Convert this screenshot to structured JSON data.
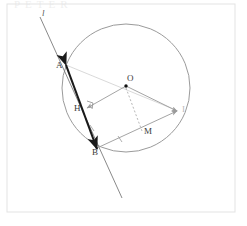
{
  "figure": {
    "watermark_text": "PETER",
    "frame": {
      "x": 7,
      "y": 4,
      "width": 228,
      "height": 208,
      "color": "#e3e3e3"
    },
    "background_color": "#ffffff",
    "circle": {
      "name": "circle-O",
      "center_x": 126,
      "center_y": 88,
      "radius": 64,
      "stroke_color": "#8f8f8f"
    },
    "points": [
      {
        "id": "A",
        "label": "A",
        "x": 66,
        "y": 66,
        "label_x": 56,
        "label_y": 61,
        "marked": false
      },
      {
        "id": "H",
        "label": "H",
        "x": 86,
        "y": 110,
        "label_x": 74,
        "label_y": 104,
        "marked": false
      },
      {
        "id": "B",
        "label": "B",
        "x": 97,
        "y": 148,
        "label_x": 92,
        "label_y": 148,
        "marked": false
      },
      {
        "id": "O",
        "label": "O",
        "x": 126,
        "y": 86,
        "label_x": 127,
        "label_y": 74,
        "marked": true
      },
      {
        "id": "M",
        "label": "M",
        "x": 142,
        "y": 130,
        "label_x": 144,
        "label_y": 127,
        "marked": false
      },
      {
        "id": "I",
        "label": "I",
        "x": 178,
        "y": 111,
        "label_x": 182,
        "label_y": 105,
        "marked": false
      }
    ],
    "line_l": {
      "name": "line-l",
      "label": "l",
      "label_x": 42,
      "label_y": 9,
      "x1": 40,
      "y1": 17,
      "x2": 122,
      "y2": 198,
      "stroke_color": "#6b6b6b"
    },
    "chord_AB": {
      "name": "chord-A-B",
      "x1": 66,
      "y1": 65,
      "x2": 97,
      "y2": 149,
      "stroke_color": "#1a1a1a",
      "stroke_width": 2.1
    },
    "vectors": [
      {
        "name": "vector-O-H",
        "x1": 126,
        "y1": 86,
        "x2": 87,
        "y2": 108,
        "color": "#9a9a9a"
      },
      {
        "name": "vector-O-I",
        "x1": 126,
        "y1": 86,
        "x2": 177,
        "y2": 111,
        "color": "#9a9a9a"
      },
      {
        "name": "vector-B-I",
        "x1": 97,
        "y1": 148,
        "x2": 177,
        "y2": 111,
        "color": "#9a9a9a"
      },
      {
        "name": "vector-B-A",
        "x1": 97,
        "y1": 149,
        "x2": 67,
        "y2": 66,
        "color": "#1a1a1a"
      }
    ],
    "ray_A_I": {
      "name": "ray-A-through-O-to-I",
      "x1": 66,
      "y1": 65,
      "x2": 178,
      "y2": 111,
      "stroke_color": "#cfcfcf"
    },
    "dashed_segment": {
      "name": "dashed-O-M",
      "x1": 126,
      "y1": 88,
      "x2": 142,
      "y2": 131,
      "stroke_color": "#a5a5a5",
      "dash": "2,2"
    },
    "right_angle_mark": {
      "name": "right-angle-mark-at-H",
      "vertex_x": 86,
      "vertex_y": 107,
      "size": 6
    },
    "tick_marks": [
      {
        "name": "tick-on-HB",
        "x": 92,
        "y": 128
      },
      {
        "name": "tick-on-BM",
        "x": 120,
        "y": 139
      }
    ]
  }
}
